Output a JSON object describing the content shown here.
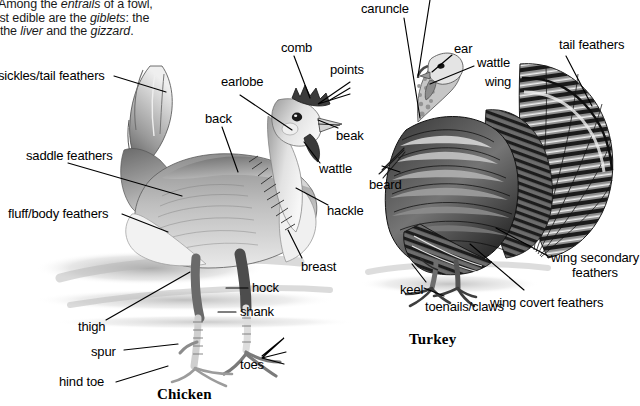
{
  "intro_text": {
    "line1_pre": "ges. Among the ",
    "line1_i1": "entrails",
    "line1_post": " of a fowl,",
    "line2_pre": "e most edible are the ",
    "line2_i1": "giblets",
    "line2_post": ": the",
    "line3_pre": "eart, the ",
    "line3_i1": "liver",
    "line3_mid": " and the ",
    "line3_i2": "gizzard",
    "line3_post": "."
  },
  "chicken": {
    "caption": "Chicken",
    "labels": [
      {
        "id": "sickles-tail-feathers",
        "text": "sickles/tail feathers"
      },
      {
        "id": "saddle-feathers",
        "text": "saddle feathers"
      },
      {
        "id": "fluff-body-feathers",
        "text": "fluff/body feathers"
      },
      {
        "id": "earlobe",
        "text": "earlobe"
      },
      {
        "id": "back",
        "text": "back"
      },
      {
        "id": "comb",
        "text": "comb"
      },
      {
        "id": "points",
        "text": "points"
      },
      {
        "id": "beak",
        "text": "beak"
      },
      {
        "id": "wattle",
        "text": "wattle"
      },
      {
        "id": "hackle",
        "text": "hackle"
      },
      {
        "id": "breast",
        "text": "breast"
      },
      {
        "id": "hock",
        "text": "hock"
      },
      {
        "id": "shank",
        "text": "shank"
      },
      {
        "id": "thigh",
        "text": "thigh"
      },
      {
        "id": "spur",
        "text": "spur"
      },
      {
        "id": "hind-toe",
        "text": "hind toe"
      },
      {
        "id": "toes",
        "text": "toes"
      }
    ]
  },
  "turkey": {
    "caption": "Turkey",
    "labels": [
      {
        "id": "caruncle",
        "text": "caruncle"
      },
      {
        "id": "ear",
        "text": "ear"
      },
      {
        "id": "wattle",
        "text": "wattle"
      },
      {
        "id": "wing",
        "text": "wing"
      },
      {
        "id": "tail-feathers",
        "text": "tail feathers"
      },
      {
        "id": "beard",
        "text": "beard"
      },
      {
        "id": "keel",
        "text": "keel"
      },
      {
        "id": "toenails-claws",
        "text": "toenails/claws"
      },
      {
        "id": "wing-secondary-feathers",
        "text": "wing secondary feathers"
      },
      {
        "id": "wing-covert-feathers",
        "text": "wing covert feathers"
      }
    ]
  },
  "colors": {
    "background": "#ffffff",
    "text": "#000000",
    "leader_line": "#000000",
    "illustration_dark": "#2b2b2b",
    "illustration_mid": "#8a8a8a",
    "illustration_light": "#d8d8d8",
    "shadow": "#bdbdbd"
  }
}
